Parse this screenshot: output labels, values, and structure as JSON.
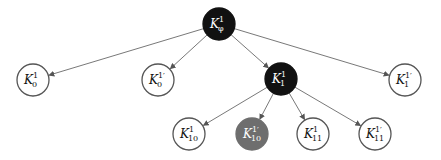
{
  "diagram": {
    "type": "tree",
    "nodes": [
      {
        "id": "root",
        "base": "K",
        "sub": "φ",
        "sup": "1",
        "prime": false,
        "x": 219,
        "y": 24,
        "fill": "#111111",
        "text_color": "#ffffff",
        "stroke": "#111111"
      },
      {
        "id": "k0",
        "base": "K",
        "sub": "0",
        "sup": "1",
        "prime": false,
        "x": 33,
        "y": 80,
        "fill": "#ffffff",
        "text_color": "#111111",
        "stroke": "#555555"
      },
      {
        "id": "k0p",
        "base": "K",
        "sub": "0",
        "sup": "1′",
        "prime": true,
        "x": 158,
        "y": 80,
        "fill": "#ffffff",
        "text_color": "#111111",
        "stroke": "#555555"
      },
      {
        "id": "k1",
        "base": "K",
        "sub": "1",
        "sup": "1",
        "prime": false,
        "x": 281,
        "y": 79,
        "fill": "#111111",
        "text_color": "#ffffff",
        "stroke": "#111111"
      },
      {
        "id": "k1p",
        "base": "K",
        "sub": "1",
        "sup": "1′",
        "prime": true,
        "x": 405,
        "y": 80,
        "fill": "#ffffff",
        "text_color": "#111111",
        "stroke": "#555555"
      },
      {
        "id": "k10",
        "base": "K",
        "sub": "10",
        "sup": "1",
        "prime": false,
        "x": 189,
        "y": 134,
        "fill": "#ffffff",
        "text_color": "#111111",
        "stroke": "#555555"
      },
      {
        "id": "k10p",
        "base": "K",
        "sub": "10",
        "sup": "1′",
        "prime": true,
        "x": 252,
        "y": 134,
        "fill": "#6e6e6e",
        "text_color": "#ffffff",
        "stroke": "#6e6e6e"
      },
      {
        "id": "k11",
        "base": "K",
        "sub": "11",
        "sup": "1",
        "prime": false,
        "x": 313,
        "y": 134,
        "fill": "#ffffff",
        "text_color": "#111111",
        "stroke": "#555555"
      },
      {
        "id": "k11p",
        "base": "K",
        "sub": "11",
        "sup": "1′",
        "prime": true,
        "x": 375,
        "y": 134,
        "fill": "#ffffff",
        "text_color": "#111111",
        "stroke": "#555555"
      }
    ],
    "edges": [
      {
        "from": "root",
        "to": "k0"
      },
      {
        "from": "root",
        "to": "k0p"
      },
      {
        "from": "root",
        "to": "k1"
      },
      {
        "from": "root",
        "to": "k1p"
      },
      {
        "from": "k1",
        "to": "k10"
      },
      {
        "from": "k1",
        "to": "k10p"
      },
      {
        "from": "k1",
        "to": "k11"
      },
      {
        "from": "k1",
        "to": "k11p"
      }
    ],
    "node_radius": 16,
    "edge_color": "#555555"
  }
}
